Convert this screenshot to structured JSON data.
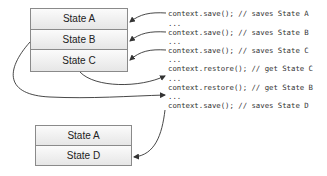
{
  "diagram": {
    "top_stack": {
      "cells": [
        "State A",
        "State B",
        "State C"
      ]
    },
    "bottom_stack": {
      "cells": [
        "State A",
        "State D"
      ]
    },
    "code_lines": [
      {
        "text": "context.save(); // saves State A",
        "top": 9
      },
      {
        "text": "...",
        "top": 19
      },
      {
        "text": "context.save(); // saves State B",
        "top": 28
      },
      {
        "text": "...",
        "top": 37
      },
      {
        "text": "context.save(); // saves State C",
        "top": 46
      },
      {
        "text": "...",
        "top": 55
      },
      {
        "text": "context.restore(); // get State C",
        "top": 64
      },
      {
        "text": "...",
        "top": 74
      },
      {
        "text": "context.restore(); // get State B",
        "top": 83
      },
      {
        "text": "...",
        "top": 92
      },
      {
        "text": "context.save(); // saves State D",
        "top": 101
      }
    ],
    "arrow_color": "#333333",
    "border_color": "#8a8a8a"
  }
}
